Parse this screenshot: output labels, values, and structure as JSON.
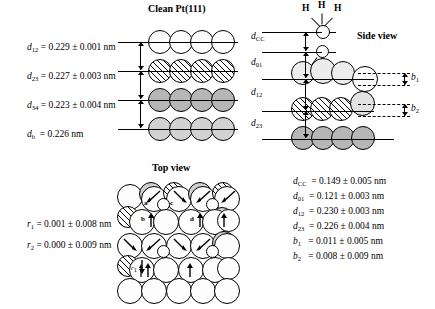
{
  "figure": {
    "titles": {
      "clean": "Clean Pt(111)",
      "side": "Side view",
      "top": "Top view"
    },
    "left_spacings": [
      {
        "sym": "d",
        "sub": "12",
        "text": "= 0.229 ± 0.001 nm"
      },
      {
        "sym": "d",
        "sub": "23",
        "text": "= 0.227 ± 0.003 nm"
      },
      {
        "sym": "d",
        "sub": "34",
        "text": "= 0.223 ± 0.004 nm"
      },
      {
        "sym": "d",
        "sub": "b",
        "text": "= 0.226 nm"
      }
    ],
    "side_markers": [
      {
        "sym": "d",
        "sub": "CC"
      },
      {
        "sym": "d",
        "sub": "01"
      },
      {
        "sym": "d",
        "sub": "12"
      },
      {
        "sym": "d",
        "sub": "23"
      }
    ],
    "buckling_markers": [
      {
        "sym": "b",
        "sub": "1"
      },
      {
        "sym": "b",
        "sub": "2"
      }
    ],
    "hydrogen_labels": [
      "H",
      "H",
      "H"
    ],
    "right_values": [
      {
        "sym": "d",
        "sub": "CC",
        "text": "= 0.149 ± 0.005 nm"
      },
      {
        "sym": "d",
        "sub": "01",
        "text": "= 0.121 ± 0.003 nm"
      },
      {
        "sym": "d",
        "sub": "12",
        "text": "= 0.230 ± 0.003 nm"
      },
      {
        "sym": "d",
        "sub": "23",
        "text": "= 0.226 ± 0.004 nm"
      },
      {
        "sym": "b",
        "sub": "1",
        "text": "= 0.011 ± 0.005 nm"
      },
      {
        "sym": "b",
        "sub": "2",
        "text": "= 0.008 ± 0.009 nm"
      }
    ],
    "top_values": [
      {
        "sym": "r",
        "sub": "1",
        "text": "= 0.001 ± 0.008 nm"
      },
      {
        "sym": "r",
        "sub": "2",
        "text": "= 0.000 ± 0.009 nm"
      }
    ],
    "top_atom_labels": [
      "a",
      "b",
      "c",
      "d"
    ],
    "top_radial_label": {
      "sym": "r",
      "sub": "1"
    },
    "colors": {
      "ink": "#000000",
      "layer1": "#ececec",
      "layer2_hatch": "#ffffff",
      "layer3": "#b6b6b6",
      "layer4": "#d2d2d2",
      "background": "#ffffff"
    }
  }
}
